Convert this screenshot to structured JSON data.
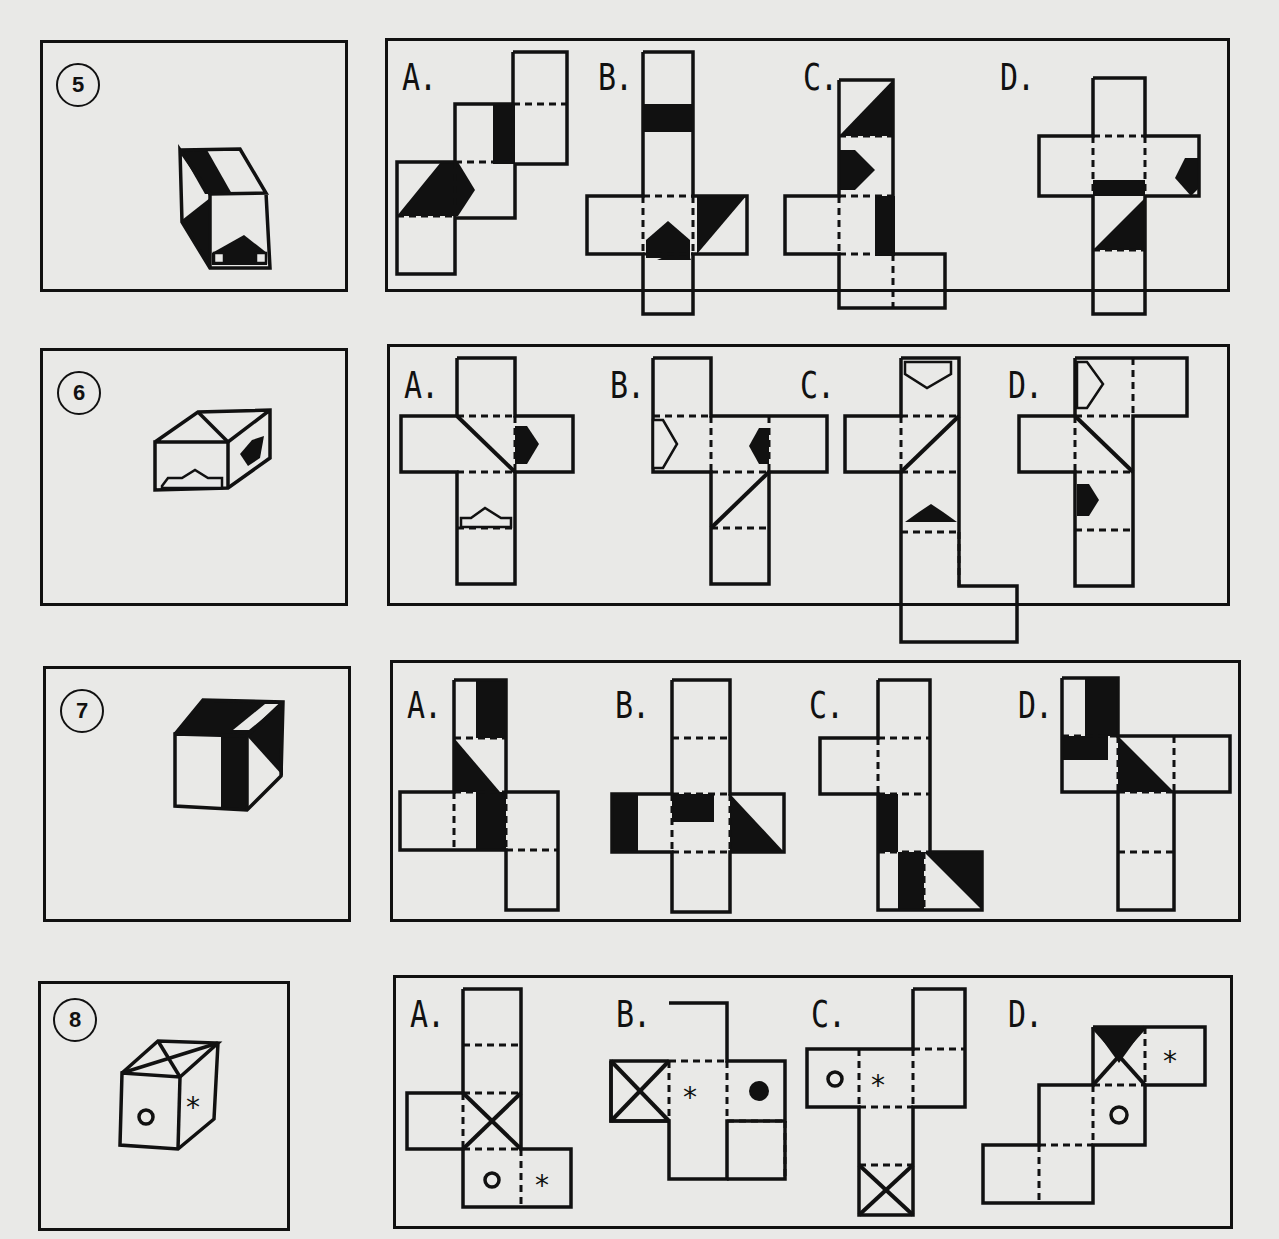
{
  "document": {
    "type": "cube-folding worksheet",
    "problems": [
      {
        "number": "5",
        "cube_faces_visible": [
          "top: black diagonal band",
          "front: black triangle left",
          "front: black arrow up",
          "right: blank"
        ],
        "options": [
          {
            "letter": "A.",
            "description": "net with black band, black triangle and black arrow pointing right"
          },
          {
            "letter": "B.",
            "description": "net with black band, black triangle and black arrow pointing up"
          },
          {
            "letter": "C.",
            "description": "net with black triangle, black arrow right and black band"
          },
          {
            "letter": "D.",
            "description": "cross net with black arrow pointing left, black band and black triangle"
          }
        ]
      },
      {
        "number": "6",
        "cube_faces_visible": [
          "top: triangle lines",
          "front: white arrow up",
          "right: black arrow"
        ],
        "options": [
          {
            "letter": "A.",
            "description": "cross net with diagonal line, black arrow right, white arrow up"
          },
          {
            "letter": "B.",
            "description": "net with white arrow right, black arrow left, diagonal line"
          },
          {
            "letter": "C.",
            "description": "net with white arrow down, diagonal line, black arrow up"
          },
          {
            "letter": "D.",
            "description": "net with white arrow right, diagonal line, black arrow right"
          }
        ]
      },
      {
        "number": "7",
        "cube_faces_visible": [
          "top: black with white stripe",
          "front: black band",
          "right: black triangle"
        ],
        "options": [
          {
            "letter": "A.",
            "description": "net with black band, black triangle, black square"
          },
          {
            "letter": "B.",
            "description": "cross net with black band, black square, black triangle"
          },
          {
            "letter": "C.",
            "description": "net with black band and black triangle"
          },
          {
            "letter": "D.",
            "description": "net with black band, black band and black triangle"
          }
        ]
      },
      {
        "number": "8",
        "cube_faces_visible": [
          "top: X",
          "front: o",
          "right: *"
        ],
        "options": [
          {
            "letter": "A.",
            "description": "net with X face, o and *",
            "symbols": [
              "o",
              "*"
            ]
          },
          {
            "letter": "B.",
            "description": "net with X face, * and filled dot",
            "symbols": [
              "*",
              "●"
            ]
          },
          {
            "letter": "C.",
            "description": "net with o, * and X face",
            "symbols": [
              "o",
              "*"
            ]
          },
          {
            "letter": "D.",
            "description": "net with half-black X face, * and o",
            "symbols": [
              "*",
              "o"
            ]
          }
        ]
      }
    ],
    "colors": {
      "paper": "#e9e9e7",
      "ink": "#111111"
    }
  }
}
